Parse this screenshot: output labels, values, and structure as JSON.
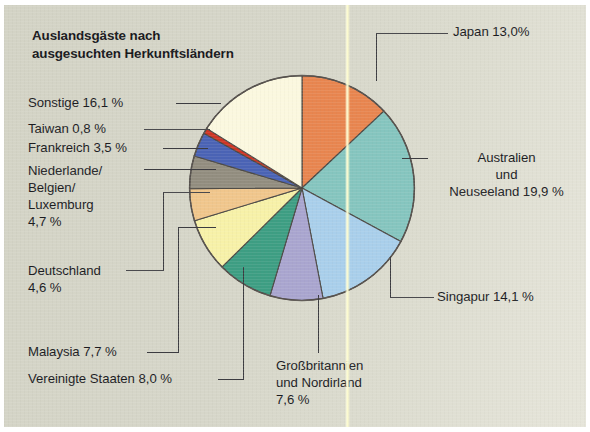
{
  "title": "Auslandsgäste\nnach ausgesuchten\nHerkunftsländern",
  "background": {
    "paper": "#d6d6c9",
    "frame": "#ffffff",
    "fold_line": "#fffde0"
  },
  "labels": {
    "sonstige": "Sonstige 16,1 %",
    "taiwan": "Taiwan 0,8 %",
    "frankreich": "Frankreich 3,5 %",
    "niederlande": "Niederlande/\nBelgien/\nLuxemburg\n4,7 %",
    "deutschland": "Deutschland\n4,6 %",
    "malaysia": "Malaysia 7,7 %",
    "vereinigte_staaten": "Vereinigte Staaten 8,0 %",
    "grossbritannien": "Großbritannien\nund Nordirland\n7,6 %",
    "japan": "Japan 13,0%",
    "australien": "Australien\nund\nNeuseeland 19,9 %",
    "singapur": "Singapur 14,1 %"
  },
  "chart_data": {
    "type": "pie",
    "title": "Auslandsgäste nach ausgesuchten Herkunftsländern",
    "xlabel": "",
    "ylabel": "",
    "unit": "%",
    "total": 100.0,
    "start_angle_deg": 0,
    "direction": "clockwise",
    "legend": "none-callout-labels",
    "grid": false,
    "categories": [
      "Japan",
      "Australien und Neuseeland",
      "Singapur",
      "Großbritannien und Nordirland",
      "Vereinigte Staaten",
      "Malaysia",
      "Deutschland",
      "Niederlande/Belgien/Luxemburg",
      "Frankreich",
      "Taiwan",
      "Sonstige"
    ],
    "values": [
      13.0,
      19.9,
      14.1,
      7.6,
      8.0,
      7.7,
      4.6,
      4.7,
      3.5,
      0.8,
      16.1
    ],
    "colors": [
      "#e8854f",
      "#85c5bf",
      "#a9cfeb",
      "#a9a5cf",
      "#3d9e83",
      "#f7f1a8",
      "#f0c68c",
      "#928d7f",
      "#4a63b5",
      "#cf3524",
      "#fbf8df"
    ],
    "slices": [
      {
        "label": "Japan",
        "value": 13.0,
        "display": "13,0%",
        "color": "#e8854f"
      },
      {
        "label": "Australien und Neuseeland",
        "value": 19.9,
        "display": "19,9 %",
        "color": "#85c5bf"
      },
      {
        "label": "Singapur",
        "value": 14.1,
        "display": "14,1 %",
        "color": "#a9cfeb"
      },
      {
        "label": "Großbritannien und Nordirland",
        "value": 7.6,
        "display": "7,6 %",
        "color": "#a9a5cf"
      },
      {
        "label": "Vereinigte Staaten",
        "value": 8.0,
        "display": "8,0 %",
        "color": "#3d9e83"
      },
      {
        "label": "Malaysia",
        "value": 7.7,
        "display": "7,7 %",
        "color": "#f7f1a8"
      },
      {
        "label": "Deutschland",
        "value": 4.6,
        "display": "4,6 %",
        "color": "#f0c68c"
      },
      {
        "label": "Niederlande/Belgien/Luxemburg",
        "value": 4.7,
        "display": "4,7 %",
        "color": "#928d7f"
      },
      {
        "label": "Frankreich",
        "value": 3.5,
        "display": "3,5 %",
        "color": "#4a63b5"
      },
      {
        "label": "Taiwan",
        "value": 0.8,
        "display": "0,8 %",
        "color": "#cf3524"
      },
      {
        "label": "Sonstige",
        "value": 16.1,
        "display": "16,1 %",
        "color": "#fbf8df"
      }
    ]
  }
}
